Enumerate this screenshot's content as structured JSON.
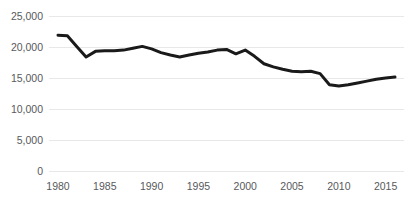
{
  "chart_data": {
    "type": "line",
    "title": "",
    "subtitle": "",
    "xlabel": "",
    "ylabel": "",
    "xlim": [
      1980,
      2016
    ],
    "ylim": [
      0,
      25000
    ],
    "grid": true,
    "grid_axis": "y",
    "legend": false,
    "legend_position": "none",
    "line_color": "#1a1a1a",
    "line_width": 3,
    "gridline_color": "#e8e8e8",
    "tick_label_color": "#58595b",
    "background_color": "#ffffff",
    "y_ticks": [
      0,
      5000,
      10000,
      15000,
      20000,
      25000
    ],
    "y_tick_labels": [
      "0",
      "5,000",
      "10,000",
      "15,000",
      "20,000",
      "25,000"
    ],
    "x_ticks": [
      1980,
      1985,
      1990,
      1995,
      2000,
      2005,
      2010,
      2015
    ],
    "x_tick_labels": [
      "1980",
      "1985",
      "1990",
      "1995",
      "2000",
      "2005",
      "2010",
      "2015"
    ],
    "x": [
      1980,
      1981,
      1982,
      1983,
      1984,
      1985,
      1986,
      1987,
      1988,
      1989,
      1990,
      1991,
      1992,
      1993,
      1994,
      1995,
      1996,
      1997,
      1998,
      1999,
      2000,
      2001,
      2002,
      2003,
      2004,
      2005,
      2006,
      2007,
      2008,
      2009,
      2010,
      2011,
      2012,
      2013,
      2014,
      2015,
      2016
    ],
    "values": [
      21900,
      21800,
      20100,
      18400,
      19300,
      19400,
      19400,
      19500,
      19800,
      20100,
      19700,
      19100,
      18700,
      18400,
      18700,
      19000,
      19200,
      19500,
      19600,
      18900,
      19500,
      18500,
      17300,
      16800,
      16400,
      16100,
      16000,
      16100,
      15700,
      13900,
      13700,
      13900,
      14200,
      14500,
      14800,
      15000,
      15150
    ],
    "series": [
      {
        "name": "Series 1",
        "color": "#1a1a1a",
        "values": [
          21900,
          21800,
          20100,
          18400,
          19300,
          19400,
          19400,
          19500,
          19800,
          20100,
          19700,
          19100,
          18700,
          18400,
          18700,
          19000,
          19200,
          19500,
          19600,
          18900,
          19500,
          18500,
          17300,
          16800,
          16400,
          16100,
          16000,
          16100,
          15700,
          13900,
          13700,
          13900,
          14200,
          14500,
          14800,
          15000,
          15150
        ]
      }
    ]
  }
}
